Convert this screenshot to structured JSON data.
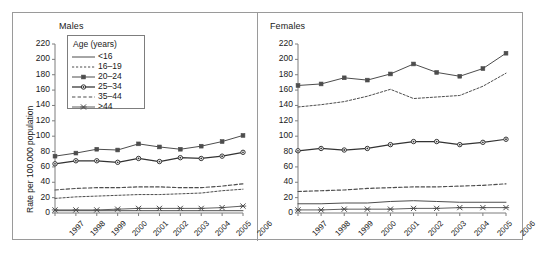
{
  "figure": {
    "ylabel": "Rate per 100,000 population",
    "caption": ""
  },
  "legend": {
    "title": "Age (years)",
    "entries": [
      {
        "label": "<16",
        "style": "solid"
      },
      {
        "label": "16–19",
        "style": "dashed-fine"
      },
      {
        "label": "20–24",
        "style": "square"
      },
      {
        "label": "25–34",
        "style": "circle"
      },
      {
        "label": "35–44",
        "style": "dashed-coarse"
      },
      {
        "label": ">44",
        "style": "cross"
      }
    ]
  },
  "chart_data": [
    {
      "type": "line",
      "title": "Males",
      "xlabel": "",
      "ylabel": "Rate per 100,000 population",
      "categories": [
        "1997",
        "1998",
        "1999",
        "2000",
        "2001",
        "2002",
        "2003",
        "2004",
        "2005",
        "2006"
      ],
      "x": [
        1997,
        1998,
        1999,
        2000,
        2001,
        2002,
        2003,
        2004,
        2005,
        2006
      ],
      "ylim": [
        0,
        220
      ],
      "yticks": [
        0,
        20,
        40,
        60,
        80,
        100,
        120,
        140,
        160,
        180,
        200,
        220
      ],
      "grid": false,
      "legend_position": "upper-left",
      "series": [
        {
          "name": "<16",
          "style": "solid",
          "values": [
            3,
            3,
            3,
            3,
            3,
            3,
            3,
            3,
            3,
            3
          ]
        },
        {
          "name": "16–19",
          "style": "dashed-fine",
          "values": [
            19,
            21,
            22,
            23,
            24,
            24,
            25,
            26,
            29,
            31
          ]
        },
        {
          "name": "20–24",
          "style": "square",
          "values": [
            74,
            78,
            83,
            82,
            90,
            86,
            83,
            87,
            93,
            101
          ]
        },
        {
          "name": "25–34",
          "style": "circle",
          "values": [
            64,
            68,
            68,
            66,
            71,
            67,
            72,
            71,
            74,
            79
          ]
        },
        {
          "name": "35–44",
          "style": "dashed-coarse",
          "values": [
            30,
            32,
            33,
            33,
            34,
            34,
            33,
            33,
            35,
            38
          ]
        },
        {
          "name": ">44",
          "style": "cross",
          "values": [
            4,
            4,
            4,
            5,
            6,
            6,
            6,
            6,
            7,
            9
          ]
        }
      ]
    },
    {
      "type": "line",
      "title": "Females",
      "xlabel": "",
      "ylabel": "Rate per 100,000 population",
      "categories": [
        "1997",
        "1998",
        "1999",
        "2000",
        "2001",
        "2002",
        "2003",
        "2004",
        "2005",
        "2006"
      ],
      "x": [
        1997,
        1998,
        1999,
        2000,
        2001,
        2002,
        2003,
        2004,
        2005,
        2006
      ],
      "ylim": [
        0,
        220
      ],
      "yticks": [
        0,
        20,
        40,
        60,
        80,
        100,
        120,
        140,
        160,
        180,
        200,
        220
      ],
      "grid": false,
      "legend_position": "none",
      "series": [
        {
          "name": "<16",
          "style": "solid",
          "values": [
            12,
            12,
            13,
            13,
            15,
            16,
            15,
            14,
            14,
            14
          ]
        },
        {
          "name": "16–19",
          "style": "dashed-fine",
          "values": [
            138,
            141,
            145,
            152,
            161,
            149,
            151,
            153,
            165,
            182
          ]
        },
        {
          "name": "20–24",
          "style": "square",
          "values": [
            166,
            168,
            176,
            173,
            181,
            194,
            183,
            178,
            188,
            208
          ]
        },
        {
          "name": "25–34",
          "style": "circle",
          "values": [
            81,
            84,
            82,
            84,
            89,
            93,
            93,
            89,
            92,
            96
          ]
        },
        {
          "name": "35–44",
          "style": "dashed-coarse",
          "values": [
            28,
            29,
            30,
            32,
            33,
            34,
            34,
            35,
            36,
            38
          ]
        },
        {
          "name": ">44",
          "style": "cross",
          "values": [
            4,
            4,
            5,
            5,
            5,
            6,
            6,
            7,
            7,
            7
          ]
        }
      ]
    }
  ]
}
